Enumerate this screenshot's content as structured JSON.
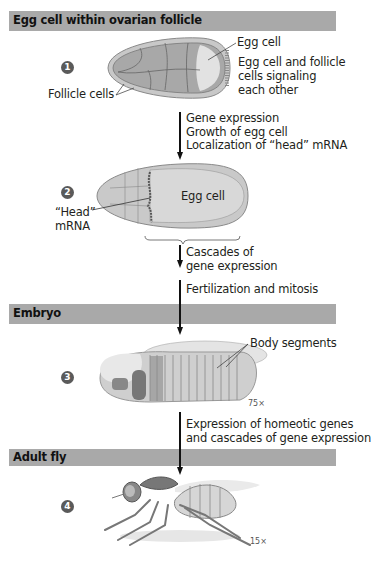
{
  "sections": [
    {
      "title": "Egg cell within ovarian follicle"
    },
    {
      "title": "Embryo"
    },
    {
      "title": "Adult fly"
    }
  ],
  "steps": [
    {
      "number": "1",
      "labels": {
        "egg_cell": "Egg cell",
        "signaling": [
          "Egg cell and follicle",
          "cells signaling",
          "each other"
        ],
        "follicle_cells": "Follicle cells"
      }
    },
    {
      "number": "2",
      "labels": {
        "egg_cell": "Egg cell",
        "head_mrna": [
          "“Head”",
          "mRNA"
        ]
      }
    },
    {
      "number": "3",
      "labels": {
        "body_segments": "Body segments",
        "magnification": "75×"
      }
    },
    {
      "number": "4",
      "labels": {
        "magnification": "15×"
      }
    }
  ],
  "transitions": [
    {
      "lines": [
        "Gene expression",
        "Growth of egg cell",
        "Localization of “head” mRNA"
      ]
    },
    {
      "lines": [
        "Cascades of",
        "gene expression"
      ]
    },
    {
      "lines": [
        "Fertilization and mitosis"
      ]
    },
    {
      "lines": [
        "Expression of homeotic genes",
        "and cascades of gene expression"
      ]
    }
  ],
  "colors": {
    "section_bar": "#a9a9a9",
    "step_circle": "#5a5a5a",
    "arrow": "#111111"
  }
}
